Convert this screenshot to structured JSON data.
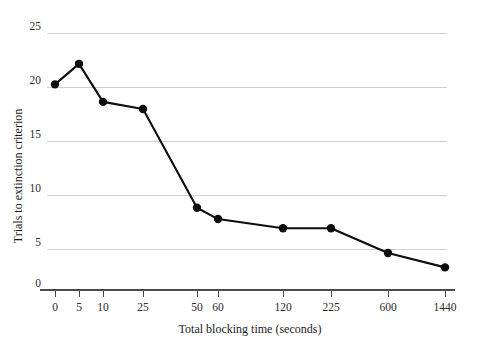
{
  "chart_data": {
    "type": "line",
    "title": "",
    "subtitle": "",
    "xlabel": "Total blocking time (seconds)",
    "ylabel": "Trials to extinction criterion",
    "categories": [
      "0",
      "5",
      "10",
      "25",
      "50",
      "60",
      "120",
      "225",
      "600",
      "1440"
    ],
    "values": [
      20,
      22,
      18.3,
      17.6,
      8,
      6.9,
      6,
      6,
      3.6,
      2.2
    ],
    "series": [
      {
        "name": "Trials to extinction criterion",
        "values": [
          20,
          22,
          18.3,
          17.6,
          8,
          6.9,
          6,
          6,
          3.6,
          2.2
        ]
      }
    ],
    "x_tick_labels": [
      "0",
      "5",
      "10",
      "25",
      "50",
      "60",
      "120",
      "225",
      "600",
      "1440"
    ],
    "y_tick_labels": [
      "0",
      "5",
      "10",
      "15",
      "20",
      "25"
    ],
    "y_tick_values": [
      0,
      5,
      10,
      15,
      20,
      25
    ],
    "ylim": [
      0,
      25
    ],
    "grid": "horizontal",
    "legend": "none",
    "marker": "filled-circle",
    "line_color": "#0d0d0d",
    "grid_color": "#cfcfcf",
    "axis_color": "#4a4a4a",
    "background_color": "#ffffff",
    "x_scale": "categorical-uneven",
    "annotations": []
  },
  "axes": {
    "y_title": "Trials to extinction criterion",
    "x_title": "Total blocking time (seconds)"
  },
  "y_ticks": [
    {
      "label": "25",
      "value": 25
    },
    {
      "label": "20",
      "value": 20
    },
    {
      "label": "15",
      "value": 15
    },
    {
      "label": "10",
      "value": 10
    },
    {
      "label": "5",
      "value": 5
    },
    {
      "label": "0",
      "value": 0
    }
  ],
  "x_ticks": [
    {
      "label": "0"
    },
    {
      "label": "5"
    },
    {
      "label": "10"
    },
    {
      "label": "25"
    },
    {
      "label": "50"
    },
    {
      "label": "60"
    },
    {
      "label": "120"
    },
    {
      "label": "225"
    },
    {
      "label": "600"
    },
    {
      "label": "1440"
    }
  ]
}
